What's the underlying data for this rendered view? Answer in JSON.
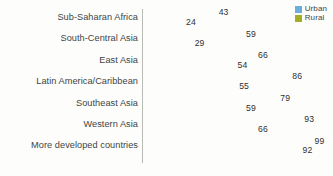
{
  "legend": {
    "position": "top-right",
    "entries": [
      {
        "label": "Urban",
        "color": "#6aaedd"
      },
      {
        "label": "Rural",
        "color": "#a3ae24"
      }
    ]
  },
  "colors": {
    "urban": "#6aaedd",
    "rural": "#a3ae24",
    "axis": "#b9bcb4",
    "label_text": "#3e4443",
    "value_text": "#2d2f2f",
    "background": "#fdfdfc"
  },
  "chart_data": {
    "type": "bar",
    "orientation": "horizontal",
    "title": "",
    "subtitle": "",
    "xlabel": "",
    "ylabel": "",
    "xlim": [
      0,
      108
    ],
    "grid": false,
    "legend_position": "top-right",
    "categories": [
      "Sub-Saharan Africa",
      "South-Central Asia",
      "East Asia",
      "Latin America/Caribbean",
      "Southeast Asia",
      "Western Asia",
      "More developed countries"
    ],
    "series": [
      {
        "name": "Urban",
        "color": "#6aaedd",
        "values": [
          43,
          59,
          66,
          86,
          79,
          93,
          99
        ]
      },
      {
        "name": "Rural",
        "color": "#a3ae24",
        "values": [
          24,
          29,
          54,
          55,
          59,
          66,
          92
        ]
      }
    ],
    "data_labels": [
      {
        "category": "Sub-Saharan Africa",
        "urban": 43,
        "rural": 24
      },
      {
        "category": "South-Central Asia",
        "urban": 59,
        "rural": 29
      },
      {
        "category": "East Asia",
        "urban": 66,
        "rural": 54
      },
      {
        "category": "Latin America/Caribbean",
        "urban": 86,
        "rural": 55
      },
      {
        "category": "Southeast Asia",
        "urban": 79,
        "rural": 59
      },
      {
        "category": "Western Asia",
        "urban": 93,
        "rural": 66
      },
      {
        "category": "More developed countries",
        "urban": 99,
        "rural": 92
      }
    ]
  }
}
